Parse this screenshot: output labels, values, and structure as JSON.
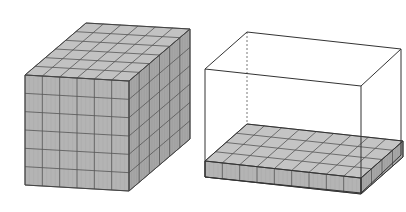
{
  "figures": [
    {
      "id": "full-prism",
      "description": "Rectangular prism completely filled with unit cubes",
      "front_columns": 6,
      "rows_high": 6,
      "depth_rows": 6,
      "colors": {
        "fill_front": "#b4b4b4",
        "fill_top": "#c2c2c2",
        "fill_side": "#a6a6a6",
        "grid": "#555555",
        "edge": "#444444"
      }
    },
    {
      "id": "empty-box-with-base-layer",
      "description": "Open rectangular box outline with a single bottom layer of unit cubes",
      "front_columns": 9,
      "rows_high": 1,
      "depth_rows": 4,
      "colors": {
        "fill_front": "#b4b4b4",
        "fill_top": "#c4c4c4",
        "fill_side": "#a6a6a6",
        "grid": "#555555",
        "edge": "#333333"
      }
    }
  ],
  "background": "#ffffff"
}
